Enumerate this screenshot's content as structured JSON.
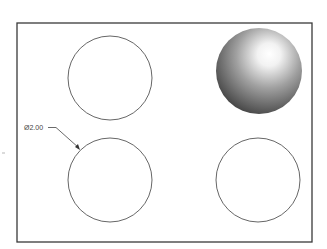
{
  "drawing": {
    "frame": {
      "x": 17,
      "y": 23,
      "width": 295,
      "height": 219,
      "stroke": "#3a3a3a"
    },
    "views": [
      {
        "name": "top-left-circle",
        "type": "circle",
        "cx": 110,
        "cy": 78,
        "r": 42
      },
      {
        "name": "shaded-sphere",
        "type": "sphere",
        "cx": 259,
        "cy": 71,
        "r": 43
      },
      {
        "name": "bottom-left-circle",
        "type": "circle",
        "cx": 110,
        "cy": 180,
        "r": 42
      },
      {
        "name": "bottom-right-circle",
        "type": "circle",
        "cx": 258,
        "cy": 180,
        "r": 42
      }
    ],
    "dimension": {
      "label": "Ø2.00",
      "text_x": 24,
      "text_y": 130,
      "leader": [
        [
          48,
          127
        ],
        [
          56,
          127
        ],
        [
          79,
          148
        ]
      ]
    },
    "colors": {
      "line": "#555555",
      "sphere_highlight": "#ffffff",
      "sphere_mid": "#9a9a9a",
      "sphere_dark": "#3c3c3c"
    }
  }
}
